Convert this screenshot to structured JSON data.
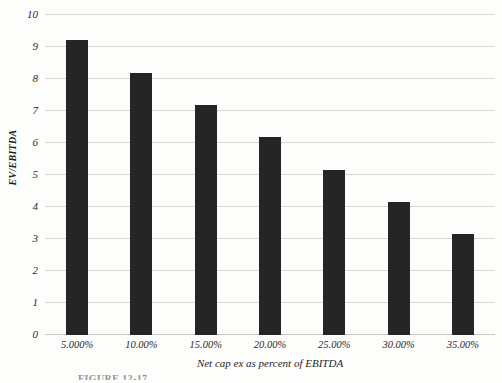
{
  "chart_data": {
    "type": "bar",
    "title": "",
    "xlabel": "Net cap ex as percent of EBITDA",
    "ylabel": "EV/EBITDA",
    "categories": [
      "5.000%",
      "10.00%",
      "15.00%",
      "20.00%",
      "25.00%",
      "30.00%",
      "35.00%"
    ],
    "values": [
      9.22,
      8.2,
      7.2,
      6.2,
      5.15,
      4.15,
      3.15
    ],
    "ylim": [
      0,
      10
    ],
    "y_ticks": [
      "0",
      "1",
      "2",
      "3",
      "4",
      "5",
      "6",
      "7",
      "8",
      "9",
      "10"
    ],
    "y_tick_values": [
      0,
      1,
      2,
      3,
      4,
      5,
      6,
      7,
      8,
      9,
      10
    ],
    "grid": true,
    "legend": "none",
    "bar_color": "#252525",
    "gridline_color": "#d8d8d6",
    "background_color": "#fdfdfc"
  },
  "figure": {
    "caption": "FIGURE 12-17"
  }
}
